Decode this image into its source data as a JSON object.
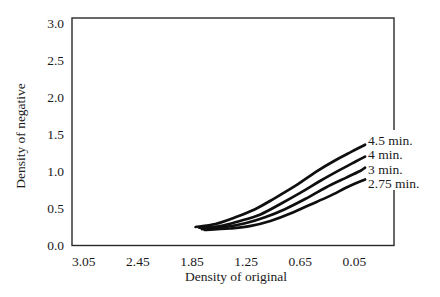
{
  "figure": {
    "background": "#ffffff",
    "line_color": "#0f0f0f",
    "border_color": "#2a2a2a"
  },
  "chart_data": {
    "type": "line",
    "title": "",
    "xlabel": "Density of original",
    "ylabel": "Density of negative",
    "x_axis_reversed": true,
    "xlim_left_to_right": [
      3.18,
      -0.39
    ],
    "ylim": [
      0,
      3.07
    ],
    "grid": false,
    "x_ticks": [
      3.05,
      2.45,
      1.85,
      1.25,
      0.65,
      0.05
    ],
    "x_tick_labels": [
      "3.05",
      "2.45",
      "1.85",
      "1.25",
      "0.65",
      "0.05"
    ],
    "y_ticks": [
      0.0,
      0.5,
      1.0,
      1.5,
      2.0,
      2.5,
      3.0
    ],
    "y_tick_labels": [
      "0.0",
      "0.5",
      "1.0",
      "1.5",
      "2.0",
      "2.5",
      "3.0"
    ],
    "legend_position": "labels-at-right-curve-ends",
    "series": [
      {
        "name": "4.5 min.",
        "points": [
          [
            1.81,
            0.25
          ],
          [
            1.59,
            0.29
          ],
          [
            1.37,
            0.38
          ],
          [
            1.15,
            0.49
          ],
          [
            0.93,
            0.64
          ],
          [
            0.71,
            0.8
          ],
          [
            0.48,
            0.99
          ],
          [
            0.26,
            1.15
          ],
          [
            0.09,
            1.26
          ],
          [
            -0.07,
            1.36
          ]
        ]
      },
      {
        "name": "4 min.",
        "points": [
          [
            1.77,
            0.24
          ],
          [
            1.54,
            0.26
          ],
          [
            1.32,
            0.33
          ],
          [
            1.09,
            0.42
          ],
          [
            0.87,
            0.56
          ],
          [
            0.65,
            0.71
          ],
          [
            0.43,
            0.87
          ],
          [
            0.21,
            1.02
          ],
          [
            0.04,
            1.13
          ],
          [
            -0.07,
            1.2
          ]
        ]
      },
      {
        "name": "3 min.",
        "points": [
          [
            1.74,
            0.22
          ],
          [
            1.48,
            0.25
          ],
          [
            1.26,
            0.3
          ],
          [
            1.04,
            0.38
          ],
          [
            0.82,
            0.49
          ],
          [
            0.59,
            0.63
          ],
          [
            0.37,
            0.78
          ],
          [
            0.15,
            0.91
          ],
          [
            -0.02,
            1.01
          ],
          [
            -0.07,
            1.05
          ]
        ]
      },
      {
        "name": "2.75 min.",
        "points": [
          [
            1.71,
            0.21
          ],
          [
            1.43,
            0.23
          ],
          [
            1.21,
            0.26
          ],
          [
            0.98,
            0.33
          ],
          [
            0.76,
            0.43
          ],
          [
            0.54,
            0.55
          ],
          [
            0.32,
            0.67
          ],
          [
            0.09,
            0.81
          ],
          [
            -0.07,
            0.89
          ]
        ]
      }
    ]
  }
}
